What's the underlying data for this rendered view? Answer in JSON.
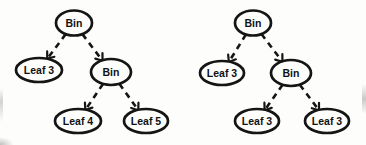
{
  "diagram": {
    "stroke_color": "#151515",
    "node_fill": "#fdfdfc",
    "text_color": "#111111",
    "edge_style": "dashed-arrow",
    "trees": [
      {
        "name": "left-tree",
        "nodes": [
          {
            "role": "root",
            "label": "Bin"
          },
          {
            "role": "left-child",
            "label": "Leaf 3"
          },
          {
            "role": "right-child",
            "label": "Bin"
          },
          {
            "role": "right-left-grandchild",
            "label": "Leaf 4"
          },
          {
            "role": "right-right-grandchild",
            "label": "Leaf 5"
          }
        ],
        "edges": [
          {
            "from": "root",
            "to": "left-child"
          },
          {
            "from": "root",
            "to": "right-child"
          },
          {
            "from": "right-child",
            "to": "right-left-grandchild"
          },
          {
            "from": "right-child",
            "to": "right-right-grandchild"
          }
        ]
      },
      {
        "name": "right-tree",
        "nodes": [
          {
            "role": "root",
            "label": "Bin"
          },
          {
            "role": "left-child",
            "label": "Leaf 3"
          },
          {
            "role": "right-child",
            "label": "Bin"
          },
          {
            "role": "right-left-grandchild",
            "label": "Leaf 3"
          },
          {
            "role": "right-right-grandchild",
            "label": "Leaf 3"
          }
        ],
        "edges": [
          {
            "from": "root",
            "to": "left-child"
          },
          {
            "from": "root",
            "to": "right-child"
          },
          {
            "from": "right-child",
            "to": "right-left-grandchild"
          },
          {
            "from": "right-child",
            "to": "right-right-grandchild"
          }
        ]
      }
    ]
  }
}
